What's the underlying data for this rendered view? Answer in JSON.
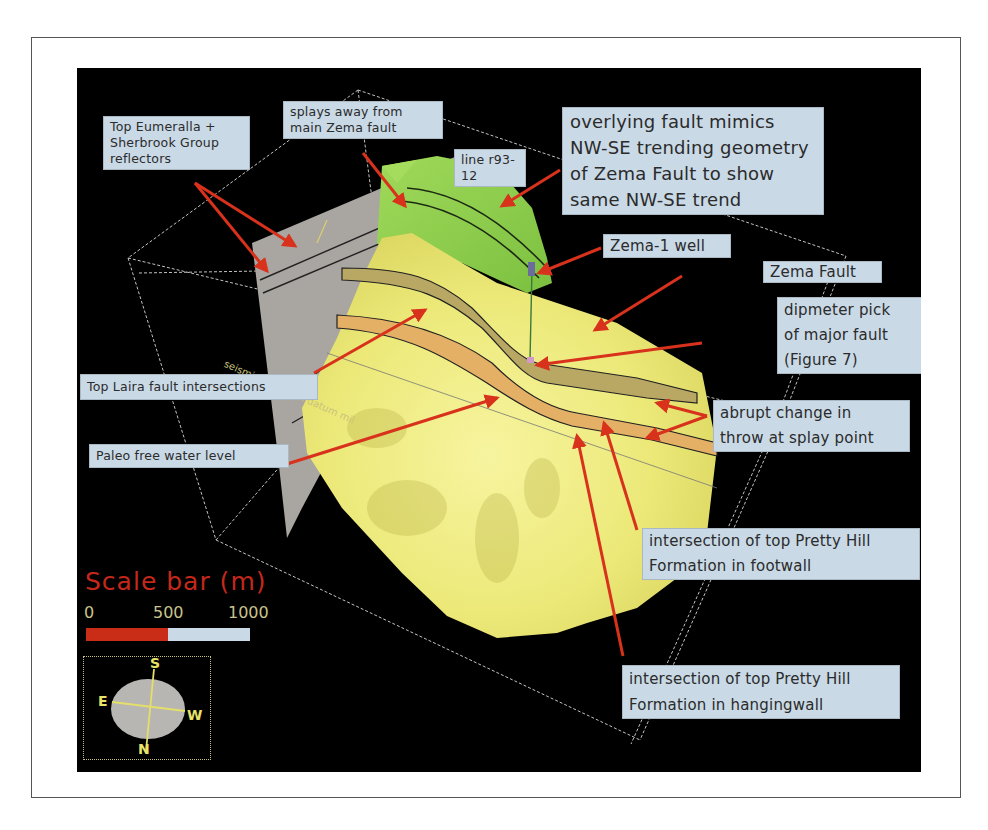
{
  "figure": {
    "colors": {
      "background_panel": "#000000",
      "callout_fill": "#c9d9e6",
      "arrow": "#d8321c",
      "yellow_surface": "#f0ee8a",
      "green_surface": "#8ccf4a",
      "seismic_section": "#a9a5a0",
      "wireframe": "#e6e6e6"
    }
  },
  "callouts": [
    {
      "id": "top-eumeralla",
      "text": "Top Eumeralla +\nSherbrook Group\nreflectors"
    },
    {
      "id": "splays-away",
      "text": "splays away from\nmain Zema fault"
    },
    {
      "id": "line-r93-12",
      "text": "line r93-12"
    },
    {
      "id": "overlying-fault",
      "text": "overlying fault mimics\nNW-SE trending geometry\nof Zema Fault to show\nsame NW-SE trend"
    },
    {
      "id": "zema-1-well",
      "text": "Zema-1 well"
    },
    {
      "id": "zema-fault",
      "text": "Zema Fault"
    },
    {
      "id": "dipmeter-pick",
      "text": "dipmeter pick\nof major fault\n(Figure 7)"
    },
    {
      "id": "top-laira",
      "text": "Top Laira fault intersections"
    },
    {
      "id": "abrupt-change",
      "text": "abrupt change in\nthrow at splay point"
    },
    {
      "id": "paleo-fwl",
      "text": "Paleo free water level"
    },
    {
      "id": "pretty-hill-footwall",
      "text": "intersection of top Pretty Hill\nFormation in footwall"
    },
    {
      "id": "pretty-hill-hangingwall",
      "text": "intersection of top Pretty Hill\nFormation in hangingwall"
    }
  ],
  "datum_label": "seismic reflection datum mil",
  "scale_bar": {
    "title": "Scale bar (m)",
    "ticks": [
      "0",
      "500",
      "1000"
    ],
    "segments": [
      {
        "from": 0,
        "to": 500,
        "color": "#c92d17"
      },
      {
        "from": 500,
        "to": 1000,
        "color": "#c9d9e6"
      }
    ]
  },
  "compass": {
    "top": "S",
    "bottom": "N",
    "left": "E",
    "right": "W"
  }
}
